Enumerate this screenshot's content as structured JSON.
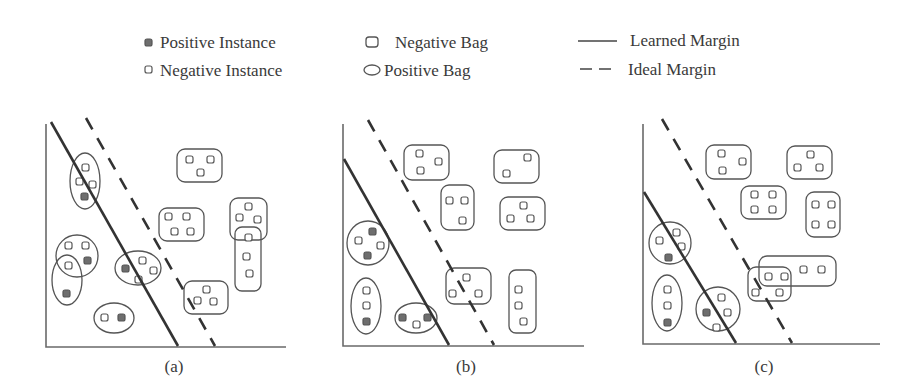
{
  "legend": {
    "positive_instance": "Positive Instance",
    "negative_instance": "Negative Instance",
    "negative_bag": "Negative Bag",
    "positive_bag": "Positive Bag",
    "learned_margin": "Learned Margin",
    "ideal_margin": "Ideal Margin"
  },
  "panels": [
    {
      "caption": "(a)",
      "positive_bags": 5,
      "negative_bags": 5
    },
    {
      "caption": "(b)",
      "positive_bags": 3,
      "negative_bags": 6
    },
    {
      "caption": "(c)",
      "positive_bags": 3,
      "negative_bags": 6
    }
  ],
  "colors": {
    "line": "#333333",
    "positive_fill": "#6e6e6e",
    "outline": "#555555",
    "axis": "#6a6a6a"
  }
}
